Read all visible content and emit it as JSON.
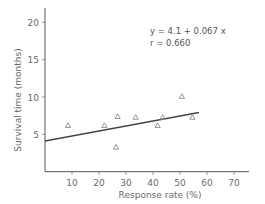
{
  "chart_data": {
    "type": "scatter",
    "title": "",
    "xlabel": "Response rate (%)",
    "ylabel": "Survival time (months)",
    "xlim": [
      0,
      75
    ],
    "ylim": [
      0,
      22
    ],
    "xticks": [
      10,
      20,
      30,
      40,
      50,
      60,
      70
    ],
    "yticks": [
      5,
      10,
      15,
      20
    ],
    "grid": false,
    "marker": "triangle-open",
    "points": [
      {
        "x": 8.5,
        "y": 6.2
      },
      {
        "x": 22,
        "y": 6.2
      },
      {
        "x": 26.9,
        "y": 7.4
      },
      {
        "x": 26.3,
        "y": 3.3
      },
      {
        "x": 33.6,
        "y": 7.3
      },
      {
        "x": 41.7,
        "y": 6.2
      },
      {
        "x": 43.6,
        "y": 7.3
      },
      {
        "x": 50.7,
        "y": 10.1
      },
      {
        "x": 54.6,
        "y": 7.3
      }
    ],
    "regression": {
      "intercept": 4.1,
      "slope": 0.067,
      "x_range": [
        0,
        57
      ],
      "equation_label": "y  =  4.1 + 0.067 x",
      "r_label": "r  =  0.660"
    },
    "colors": {
      "axis": "#555555",
      "text": "#6a6a6a",
      "line": "#444444",
      "marker": "#8a8a8a"
    }
  }
}
